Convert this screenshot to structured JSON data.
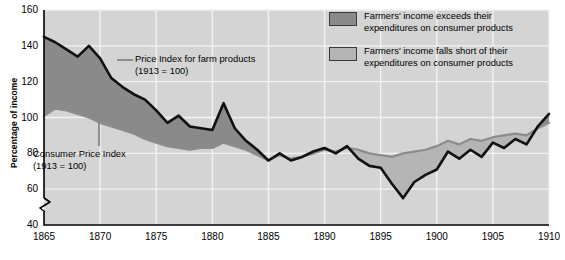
{
  "axes": {
    "ylabel": "Percentage of income",
    "yticks": [
      "160",
      "140",
      "120",
      "100",
      "80",
      "60",
      "40"
    ],
    "xticks": [
      "1865",
      "1870",
      "1875",
      "1880",
      "1885",
      "1890",
      "1895",
      "1900",
      "1905",
      "1910"
    ],
    "axis_break": "axis-break-zigzag"
  },
  "annotations": [
    {
      "line1": "Price Index for farm products",
      "line2": "(1913 = 100)"
    },
    {
      "line1": "Consumer Price Index",
      "line2": "(1913 = 100)"
    }
  ],
  "legend": [
    {
      "swatch": "dark-gray",
      "color": "#8a8a8a",
      "line1": "Farmers' income exceeds their",
      "line2": "expenditures on consumer products"
    },
    {
      "swatch": "light-gray",
      "color": "#b5b5b5",
      "line1": "Farmers' income falls short of their",
      "line2": "expenditures on consumer products"
    }
  ],
  "colors": {
    "plot_background": "#d4d4d4",
    "gridline": "#f2f2f2",
    "farm_line": "#111111",
    "cpi_line": "#8c8c8c",
    "fill_exceeds": "#8a8a8a",
    "fill_short": "#b5b5b5"
  },
  "chart_data": {
    "type": "area",
    "title": "",
    "subtitle": "",
    "xlabel": "",
    "ylabel": "Percentage of income",
    "xlim": [
      1865,
      1910
    ],
    "ylim": [
      40,
      160
    ],
    "grid": true,
    "legend_position": "top-right",
    "axis_note": "y-axis broken below 40",
    "x": [
      1865,
      1866,
      1867,
      1868,
      1869,
      1870,
      1871,
      1872,
      1873,
      1874,
      1875,
      1876,
      1877,
      1878,
      1879,
      1880,
      1881,
      1882,
      1883,
      1884,
      1885,
      1886,
      1887,
      1888,
      1889,
      1890,
      1891,
      1892,
      1893,
      1894,
      1895,
      1896,
      1897,
      1898,
      1899,
      1900,
      1901,
      1902,
      1903,
      1904,
      1905,
      1906,
      1907,
      1908,
      1909,
      1910
    ],
    "series": [
      {
        "name": "Price Index for farm products (1913 = 100)",
        "color": "#111111",
        "values": [
          145,
          142,
          138,
          134,
          140,
          133,
          122,
          117,
          113,
          110,
          104,
          97,
          101,
          95,
          94,
          93,
          108,
          94,
          87,
          82,
          76,
          80,
          76,
          78,
          81,
          83,
          80,
          84,
          77,
          73,
          72,
          63,
          55,
          64,
          68,
          71,
          81,
          77,
          82,
          78,
          86,
          83,
          88,
          85,
          95,
          102
        ]
      },
      {
        "name": "Consumer Price Index (1913 = 100)",
        "color": "#8c8c8c",
        "values": [
          101,
          105,
          104,
          102,
          100,
          97,
          95,
          93,
          91,
          88,
          86,
          84,
          83,
          82,
          83,
          83,
          86,
          84,
          82,
          79,
          76,
          79,
          77,
          78,
          80,
          82,
          81,
          83,
          82,
          80,
          79,
          78,
          80,
          81,
          82,
          84,
          87,
          85,
          88,
          87,
          89,
          90,
          91,
          90,
          94,
          97
        ]
      }
    ],
    "fill_rule": "farm above cpi = dark gray (income exceeds); farm below cpi = light gray (income falls short)"
  }
}
